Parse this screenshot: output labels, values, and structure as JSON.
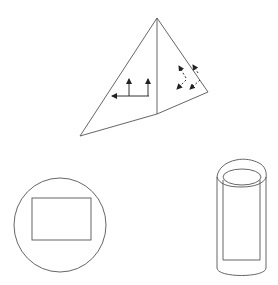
{
  "diagram": {
    "colors": {
      "stroke": "#555555",
      "arrow": "#222222",
      "background": "#ffffff"
    },
    "shapes": [
      {
        "id": "pyramid",
        "type": "pyramid",
        "arrows_left_face": 3,
        "arrows_right_face": 4
      },
      {
        "id": "circle-with-rectangle",
        "type": "circle",
        "inner": "rectangle"
      },
      {
        "id": "cylinder-with-rectangle",
        "type": "cylinder",
        "inner": "rectangle"
      }
    ]
  }
}
